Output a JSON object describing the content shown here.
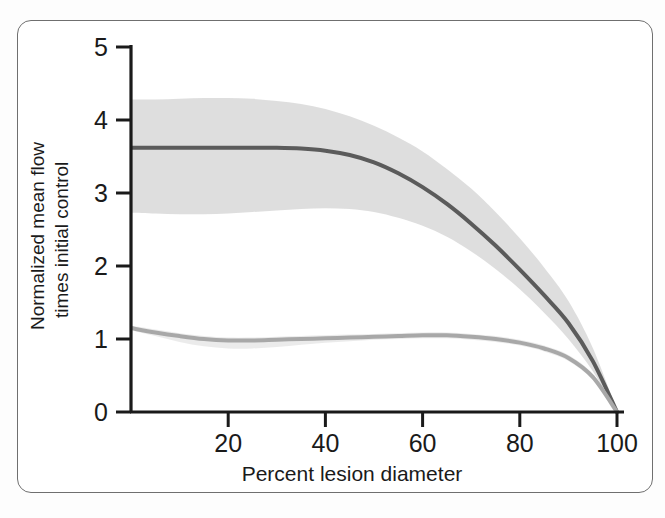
{
  "figure": {
    "background_color": "#ffffff",
    "frame_color": "#6f6f6f"
  },
  "chart_data": {
    "type": "line",
    "title": "",
    "subtitle": "",
    "xlabel": "Percent lesion diameter",
    "ylabel": "Normalized mean flow times initial control",
    "ylabel_line1": "Normalized mean flow",
    "ylabel_line2": "times initial control",
    "xlim": [
      0,
      104
    ],
    "ylim": [
      0,
      5
    ],
    "xticks": [
      20,
      40,
      60,
      80,
      100
    ],
    "xticklabels": [
      "20",
      "40",
      "60",
      "80",
      "100"
    ],
    "yticks": [
      0,
      1,
      2,
      3,
      4,
      5
    ],
    "yticklabels": [
      "0",
      "1",
      "2",
      "3",
      "4",
      "5"
    ],
    "grid": false,
    "legend": false,
    "legend_position": "none",
    "x": [
      0,
      5,
      10,
      15,
      20,
      25,
      30,
      35,
      40,
      45,
      50,
      55,
      60,
      65,
      70,
      75,
      80,
      85,
      90,
      95,
      100
    ],
    "series": [
      {
        "name": "Maximal vasodilation flow",
        "color": "#5b5b5b",
        "line_width_px": 4,
        "values": [
          3.62,
          3.62,
          3.62,
          3.62,
          3.62,
          3.62,
          3.62,
          3.61,
          3.58,
          3.52,
          3.42,
          3.27,
          3.08,
          2.85,
          2.58,
          2.28,
          1.95,
          1.6,
          1.22,
          0.7,
          0.0
        ],
        "band": {
          "name": "confidence-band-dark",
          "color": "#d8d8d8",
          "opacity": 0.85,
          "upper": [
            4.28,
            4.28,
            4.29,
            4.3,
            4.3,
            4.29,
            4.26,
            4.22,
            4.15,
            4.05,
            3.92,
            3.76,
            3.57,
            3.33,
            3.06,
            2.74,
            2.38,
            1.98,
            1.52,
            0.88,
            0.02
          ],
          "lower": [
            2.73,
            2.72,
            2.71,
            2.71,
            2.72,
            2.74,
            2.76,
            2.78,
            2.79,
            2.78,
            2.74,
            2.66,
            2.55,
            2.4,
            2.2,
            1.96,
            1.68,
            1.36,
            1.0,
            0.56,
            0.0
          ]
        }
      },
      {
        "name": "Resting flow",
        "color": "#a8a8a8",
        "line_width_px": 4,
        "values": [
          1.15,
          1.09,
          1.04,
          1.0,
          0.98,
          0.98,
          0.99,
          1.0,
          1.01,
          1.02,
          1.03,
          1.04,
          1.05,
          1.05,
          1.03,
          1.0,
          0.95,
          0.87,
          0.74,
          0.48,
          0.0
        ],
        "band": {
          "name": "confidence-band-light",
          "color": "#e8e8e8",
          "opacity": 0.85,
          "upper": [
            1.18,
            1.13,
            1.08,
            1.04,
            1.02,
            1.02,
            1.03,
            1.04,
            1.05,
            1.06,
            1.07,
            1.08,
            1.09,
            1.09,
            1.07,
            1.04,
            0.99,
            0.91,
            0.78,
            0.52,
            0.02
          ],
          "lower": [
            1.12,
            1.04,
            0.96,
            0.9,
            0.87,
            0.87,
            0.89,
            0.92,
            0.95,
            0.97,
            0.99,
            1.0,
            1.01,
            1.01,
            0.99,
            0.96,
            0.91,
            0.83,
            0.7,
            0.44,
            0.0
          ]
        }
      }
    ]
  },
  "axes": {
    "axis_color": "#1a1a1a",
    "tick_color": "#1a1a1a"
  }
}
